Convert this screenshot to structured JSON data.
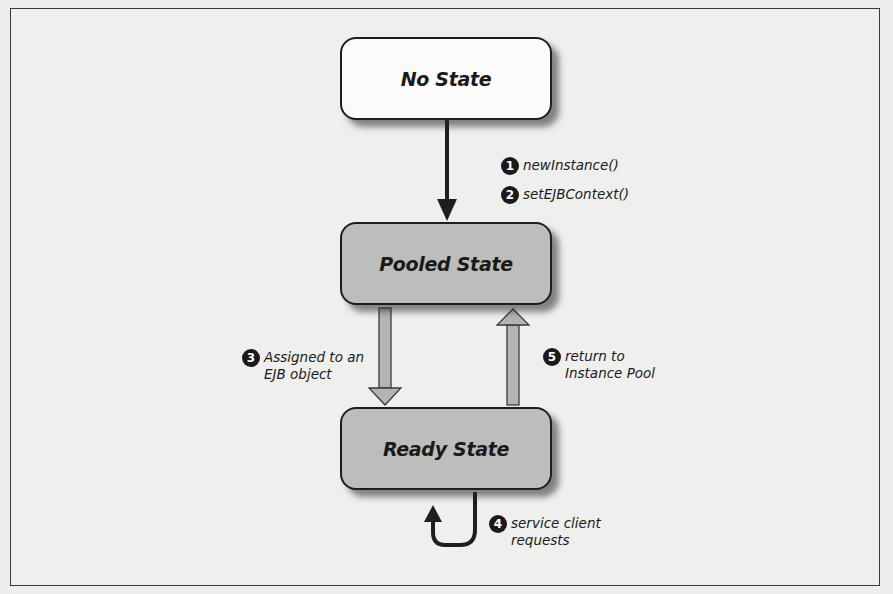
{
  "diagram": {
    "states": [
      {
        "id": "no-state",
        "label": "No State",
        "fill": "#fbfbfa"
      },
      {
        "id": "pooled-state",
        "label": "Pooled State",
        "fill": "#bdbdbb"
      },
      {
        "id": "ready-state",
        "label": "Ready State",
        "fill": "#bdbdbb"
      }
    ],
    "transitions": [
      {
        "step": "1",
        "label": "newInstance()",
        "from": "No State",
        "to": "Pooled State"
      },
      {
        "step": "2",
        "label": "setEJBContext()",
        "from": "No State",
        "to": "Pooled State"
      },
      {
        "step": "3",
        "label": "Assigned to an\nEJB object",
        "from": "Pooled State",
        "to": "Ready State"
      },
      {
        "step": "4",
        "label": "service client\nrequests",
        "from": "Ready State",
        "to": "Ready State"
      },
      {
        "step": "5",
        "label": "return to\nInstance Pool",
        "from": "Ready State",
        "to": "Pooled State"
      }
    ],
    "colors": {
      "outline": "#1e1e1e",
      "pooled_fill": "#bdbdbb",
      "arrow_gray": "#b4b4b2",
      "background": "#efefed"
    }
  }
}
